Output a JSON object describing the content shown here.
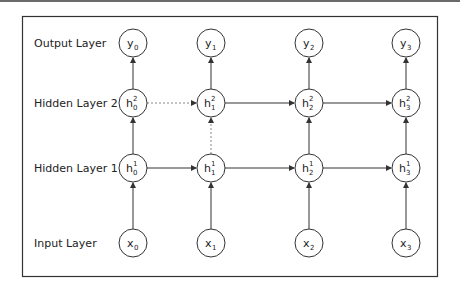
{
  "diagram": {
    "type": "stacked-rnn-unrolled",
    "colors": {
      "stroke": "#333333",
      "frame": "#333333",
      "background": "#ffffff",
      "dashed": "#777777"
    },
    "row_labels": [
      {
        "id": "output",
        "label": "Output Layer"
      },
      {
        "id": "hidden2",
        "label": "Hidden Layer 2"
      },
      {
        "id": "hidden1",
        "label": "Hidden Layer 1"
      },
      {
        "id": "input",
        "label": "Input Layer"
      }
    ],
    "nodes": {
      "output": [
        {
          "base": "y",
          "sub": "0",
          "sup": ""
        },
        {
          "base": "y",
          "sub": "1",
          "sup": ""
        },
        {
          "base": "y",
          "sub": "2",
          "sup": ""
        },
        {
          "base": "y",
          "sub": "3",
          "sup": ""
        }
      ],
      "hidden2": [
        {
          "base": "h",
          "sub": "0",
          "sup": "2"
        },
        {
          "base": "h",
          "sub": "1",
          "sup": "2"
        },
        {
          "base": "h",
          "sub": "2",
          "sup": "2"
        },
        {
          "base": "h",
          "sub": "3",
          "sup": "2"
        }
      ],
      "hidden1": [
        {
          "base": "h",
          "sub": "0",
          "sup": "1"
        },
        {
          "base": "h",
          "sub": "1",
          "sup": "1"
        },
        {
          "base": "h",
          "sub": "2",
          "sup": "1"
        },
        {
          "base": "h",
          "sub": "3",
          "sup": "1"
        }
      ],
      "input": [
        {
          "base": "x",
          "sub": "0",
          "sup": ""
        },
        {
          "base": "x",
          "sub": "1",
          "sup": ""
        },
        {
          "base": "x",
          "sub": "2",
          "sup": ""
        },
        {
          "base": "x",
          "sub": "3",
          "sup": ""
        }
      ]
    },
    "edges_note": "Vertical arrows input→h1→h2→output per timestep; horizontal arrows between consecutive h nodes; h0²→h1² horizontal and h1¹→h1² vertical are dotted."
  }
}
